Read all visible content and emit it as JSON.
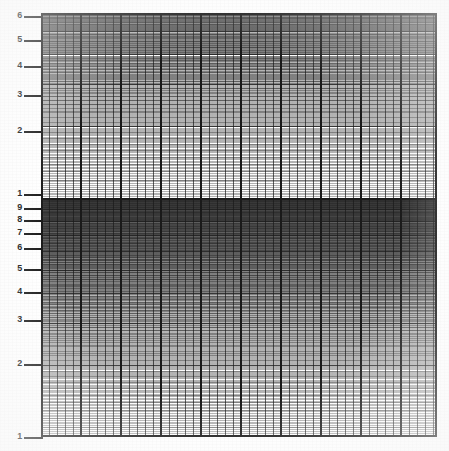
{
  "document": {
    "title": "Semi-logarithmic graph paper",
    "background_color": "#ffffff",
    "ink_color": "#1a1a1a"
  },
  "plot": {
    "left_px": 41,
    "top_px": 13,
    "width_px": 396,
    "height_px": 424,
    "frame_color": "#141414"
  },
  "chart_data": {
    "type": "line",
    "title": "",
    "subtitle": "",
    "xlabel": "",
    "ylabel": "",
    "grid": true,
    "legend": "none",
    "series": [],
    "x": [],
    "x_scale": "linear",
    "y_scale": "log",
    "xlim": [
      0,
      49
    ],
    "ylim": [
      1,
      60
    ],
    "y_tick_labels": [
      "6",
      "5",
      "4",
      "3",
      "2",
      "1",
      "9",
      "8",
      "7",
      "6",
      "5",
      "4",
      "3",
      "2",
      "1"
    ],
    "y_tick_values": [
      60,
      50,
      40,
      30,
      20,
      10,
      9,
      8,
      7,
      6,
      5,
      4,
      3,
      2,
      1
    ],
    "y_tick_pixels": [
      16,
      40,
      66,
      95,
      131,
      194,
      208,
      220,
      233,
      248,
      269,
      292,
      320,
      364,
      437
    ],
    "x_tick_labels": [],
    "x_major_spacing_px": 40,
    "x_minor_spacing_px": 8
  },
  "y_axis": {
    "labels": [
      {
        "text": "6",
        "y": 16,
        "leader_width": 30
      },
      {
        "text": "5",
        "y": 40,
        "leader_width": 30
      },
      {
        "text": "4",
        "y": 66,
        "leader_width": 30
      },
      {
        "text": "3",
        "y": 95,
        "leader_width": 30
      },
      {
        "text": "2",
        "y": 131,
        "leader_width": 30
      },
      {
        "text": "1",
        "y": 194,
        "leader_width": 30
      },
      {
        "text": "9",
        "y": 208,
        "leader_width": 30
      },
      {
        "text": "8",
        "y": 220,
        "leader_width": 30
      },
      {
        "text": "7",
        "y": 233,
        "leader_width": 30
      },
      {
        "text": "6",
        "y": 248,
        "leader_width": 30
      },
      {
        "text": "5",
        "y": 269,
        "leader_width": 30
      },
      {
        "text": "4",
        "y": 292,
        "leader_width": 30
      },
      {
        "text": "3",
        "y": 320,
        "leader_width": 30
      },
      {
        "text": "2",
        "y": 364,
        "leader_width": 30
      },
      {
        "text": "1",
        "y": 437,
        "leader_width": 30
      }
    ]
  }
}
